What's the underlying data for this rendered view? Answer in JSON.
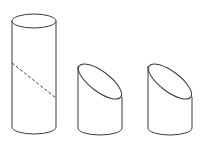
{
  "diagram": {
    "line_color": "#3a3a3a",
    "background": "#ffffff",
    "shapes": [
      {
        "id": "full-cylinder",
        "label": "",
        "left_x": 12,
        "right_x": 56,
        "top_ellipse": {
          "cx": 34,
          "cy": 21,
          "rx": 22,
          "ry": 7
        },
        "bottom_ellipse": {
          "cx": 34,
          "cy": 127,
          "rx": 22,
          "ry": 7
        },
        "cut_line": {
          "style": "dashed",
          "from": [
            12,
            63
          ],
          "to": [
            56,
            98
          ]
        }
      },
      {
        "id": "cut-piece-1",
        "label": "",
        "left_x": 78,
        "right_x": 122,
        "oblique_top": {
          "from": [
            78,
            65
          ],
          "to": [
            122,
            98
          ]
        },
        "bottom_ellipse": {
          "cx": 100,
          "cy": 128,
          "rx": 22,
          "ry": 7
        }
      },
      {
        "id": "cut-piece-2",
        "label": "",
        "left_x": 148,
        "right_x": 192,
        "oblique_top": {
          "from": [
            148,
            65
          ],
          "to": [
            192,
            98
          ]
        },
        "bottom_ellipse": {
          "cx": 170,
          "cy": 128,
          "rx": 22,
          "ry": 7
        }
      }
    ]
  }
}
